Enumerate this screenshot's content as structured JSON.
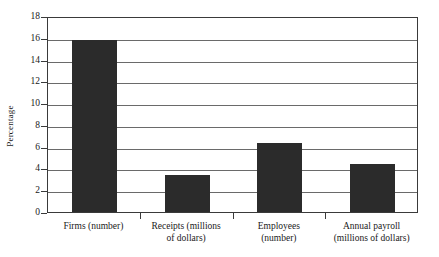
{
  "chart_data": {
    "type": "bar",
    "title": "",
    "xlabel": "",
    "ylabel": "Percentage",
    "categories": [
      "Firms (number)",
      "Receipts (millions of dollars)",
      "Employees (number)",
      "Annual payroll (millions of dollars)"
    ],
    "category_lines": [
      [
        "Firms (number)"
      ],
      [
        "Receipts (millions",
        "of dollars)"
      ],
      [
        "Employees",
        "(number)"
      ],
      [
        "Annual payroll",
        "(millions of dollars)"
      ]
    ],
    "values": [
      15.8,
      3.4,
      6.3,
      4.4
    ],
    "ylim": [
      0,
      18
    ],
    "ytick_values": [
      0,
      2,
      4,
      6,
      8,
      10,
      12,
      14,
      16,
      18
    ],
    "ytick_labels": [
      "0",
      "2",
      "4",
      "6",
      "8",
      "10",
      "12",
      "14",
      "16",
      "18"
    ],
    "grid": true,
    "legend": "none",
    "bar_color": "#2b2b2b",
    "grid_color": "#6a6a6a",
    "axis_color": "#3a3a3a",
    "background_color": "#ffffff"
  }
}
